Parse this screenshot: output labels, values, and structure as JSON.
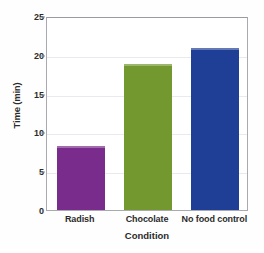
{
  "chart_data": {
    "type": "bar",
    "title": "",
    "subtitle": "",
    "xlabel": "Condition",
    "ylabel": "Time (min)",
    "categories": [
      "Radish",
      "Chocolate",
      "No food control"
    ],
    "values": [
      8.3,
      18.8,
      20.9
    ],
    "series": [
      {
        "name": "Time (min)",
        "values": [
          8.3,
          18.8,
          20.9
        ]
      }
    ],
    "ylim": [
      0,
      25
    ],
    "yticks": [
      0,
      5,
      10,
      15,
      20,
      25
    ],
    "ytick_labels": [
      "0",
      "5",
      "10",
      "15",
      "20",
      "25"
    ],
    "grid": true,
    "grid_axis": "y",
    "legend": false,
    "legend_position": "none",
    "bar_colors": [
      "#7a2c8c",
      "#72982f",
      "#1f3f96"
    ],
    "annotations": []
  },
  "axes": {
    "y_title": "Time (min)",
    "x_title": "Condition",
    "frame_color": "#a9aab0",
    "gridline_color": "#e9eaee",
    "tick_color": "#8e8e94",
    "label_color": "#2b2b2b"
  },
  "background": {
    "page": "#ffffff",
    "plot": "#ffffff"
  }
}
